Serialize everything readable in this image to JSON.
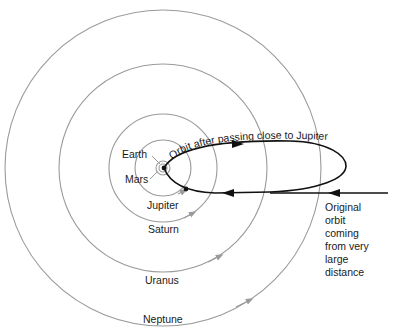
{
  "diagram": {
    "title_label": "Orbit after passing close to Jupiter",
    "center": {
      "x": 163,
      "y": 168
    },
    "colors": {
      "orbit": "#9a9a9a",
      "comet": "#111111",
      "text": "#1a1a1a",
      "background": "#ffffff"
    },
    "planets": [
      {
        "name": "Earth",
        "radius": 4
      },
      {
        "name": "Mars",
        "radius": 7
      },
      {
        "name": "Jupiter",
        "radius": 28
      },
      {
        "name": "Saturn",
        "radius": 54
      },
      {
        "name": "Uranus",
        "radius": 104
      },
      {
        "name": "Neptune",
        "radius": 158
      }
    ],
    "labels": {
      "earth": "Earth",
      "mars": "Mars",
      "jupiter": "Jupiter",
      "saturn": "Saturn",
      "uranus": "Uranus",
      "neptune": "Neptune"
    },
    "original_orbit_lines": [
      "Original",
      "orbit",
      "coming",
      "from very",
      "large",
      "distance"
    ]
  }
}
